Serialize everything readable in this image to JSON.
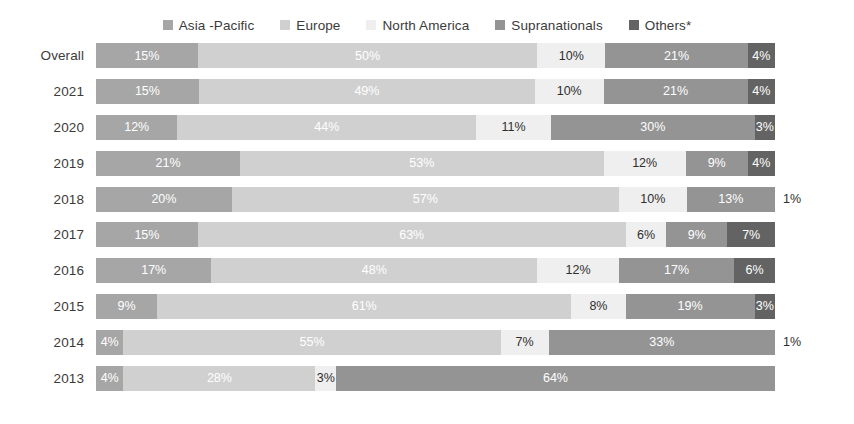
{
  "chart_data": {
    "type": "bar",
    "subtype": "stacked-horizontal-100percent",
    "title": "",
    "subtitle": "",
    "xlabel": "",
    "ylabel": "",
    "xlim": [
      0,
      100
    ],
    "grid": false,
    "legend_position": "top-center",
    "unit": "%",
    "categories": [
      "Overall",
      "2021",
      "2020",
      "2019",
      "2018",
      "2017",
      "2016",
      "2015",
      "2014",
      "2013"
    ],
    "series": [
      {
        "name": "Asia -Pacific",
        "color": "#a6a6a6",
        "values": [
          15,
          15,
          12,
          21,
          20,
          15,
          17,
          9,
          4,
          4
        ]
      },
      {
        "name": "Europe",
        "color": "#d0d0d0",
        "values": [
          50,
          49,
          44,
          53,
          57,
          63,
          48,
          61,
          55,
          28
        ]
      },
      {
        "name": "North America",
        "color": "#efefef",
        "values": [
          10,
          10,
          11,
          12,
          10,
          6,
          12,
          8,
          7,
          3
        ]
      },
      {
        "name": "Supranationals",
        "color": "#949494",
        "values": [
          21,
          21,
          30,
          9,
          13,
          9,
          17,
          19,
          33,
          64
        ]
      },
      {
        "name": "Others*",
        "color": "#636363",
        "values": [
          4,
          4,
          3,
          4,
          1,
          7,
          6,
          3,
          1,
          0
        ]
      }
    ]
  },
  "legend": {
    "items": [
      {
        "label": "Asia  -Pacific",
        "color": "#a6a6a6",
        "icon": "legend-swatch-icon"
      },
      {
        "label": "Europe",
        "color": "#d0d0d0",
        "icon": "legend-swatch-icon"
      },
      {
        "label": "North America",
        "color": "#efefef",
        "icon": "legend-swatch-icon"
      },
      {
        "label": "Supranationals",
        "color": "#949494",
        "icon": "legend-swatch-icon"
      },
      {
        "label": "Others*",
        "color": "#636363",
        "icon": "legend-swatch-icon"
      }
    ]
  },
  "rows": [
    {
      "label": "Overall",
      "segments": [
        {
          "series": "Asia -Pacific",
          "value": 15,
          "text": "15%",
          "color": "#a6a6a6",
          "text_color": "light",
          "outside": false
        },
        {
          "series": "Europe",
          "value": 50,
          "text": "50%",
          "color": "#d0d0d0",
          "text_color": "light",
          "outside": false
        },
        {
          "series": "North America",
          "value": 10,
          "text": "10%",
          "color": "#efefef",
          "text_color": "dark",
          "outside": false
        },
        {
          "series": "Supranationals",
          "value": 21,
          "text": "21%",
          "color": "#949494",
          "text_color": "light",
          "outside": false
        },
        {
          "series": "Others*",
          "value": 4,
          "text": "4%",
          "color": "#636363",
          "text_color": "light",
          "outside": false
        }
      ],
      "outside_label": ""
    },
    {
      "label": "2021",
      "segments": [
        {
          "series": "Asia -Pacific",
          "value": 15,
          "text": "15%",
          "color": "#a6a6a6",
          "text_color": "light",
          "outside": false
        },
        {
          "series": "Europe",
          "value": 49,
          "text": "49%",
          "color": "#d0d0d0",
          "text_color": "light",
          "outside": false
        },
        {
          "series": "North America",
          "value": 10,
          "text": "10%",
          "color": "#efefef",
          "text_color": "dark",
          "outside": false
        },
        {
          "series": "Supranationals",
          "value": 21,
          "text": "21%",
          "color": "#949494",
          "text_color": "light",
          "outside": false
        },
        {
          "series": "Others*",
          "value": 4,
          "text": "4%",
          "color": "#636363",
          "text_color": "light",
          "outside": false
        }
      ],
      "outside_label": ""
    },
    {
      "label": "2020",
      "segments": [
        {
          "series": "Asia -Pacific",
          "value": 12,
          "text": "12%",
          "color": "#a6a6a6",
          "text_color": "light",
          "outside": false
        },
        {
          "series": "Europe",
          "value": 44,
          "text": "44%",
          "color": "#d0d0d0",
          "text_color": "light",
          "outside": false
        },
        {
          "series": "North America",
          "value": 11,
          "text": "11%",
          "color": "#efefef",
          "text_color": "dark",
          "outside": false
        },
        {
          "series": "Supranationals",
          "value": 30,
          "text": "30%",
          "color": "#949494",
          "text_color": "light",
          "outside": false
        },
        {
          "series": "Others*",
          "value": 3,
          "text": "3%",
          "color": "#636363",
          "text_color": "light",
          "outside": false
        }
      ],
      "outside_label": ""
    },
    {
      "label": "2019",
      "segments": [
        {
          "series": "Asia -Pacific",
          "value": 21,
          "text": "21%",
          "color": "#a6a6a6",
          "text_color": "light",
          "outside": false
        },
        {
          "series": "Europe",
          "value": 53,
          "text": "53%",
          "color": "#d0d0d0",
          "text_color": "light",
          "outside": false
        },
        {
          "series": "North America",
          "value": 12,
          "text": "12%",
          "color": "#efefef",
          "text_color": "dark",
          "outside": false
        },
        {
          "series": "Supranationals",
          "value": 9,
          "text": "9%",
          "color": "#949494",
          "text_color": "light",
          "outside": false
        },
        {
          "series": "Others*",
          "value": 4,
          "text": "4%",
          "color": "#636363",
          "text_color": "light",
          "outside": false
        }
      ],
      "outside_label": ""
    },
    {
      "label": "2018",
      "segments": [
        {
          "series": "Asia -Pacific",
          "value": 20,
          "text": "20%",
          "color": "#a6a6a6",
          "text_color": "light",
          "outside": false
        },
        {
          "series": "Europe",
          "value": 57,
          "text": "57%",
          "color": "#d0d0d0",
          "text_color": "light",
          "outside": false
        },
        {
          "series": "North America",
          "value": 10,
          "text": "10%",
          "color": "#efefef",
          "text_color": "dark",
          "outside": false
        },
        {
          "series": "Supranationals",
          "value": 13,
          "text": "13%",
          "color": "#949494",
          "text_color": "light",
          "outside": false
        },
        {
          "series": "Others*",
          "value": 1,
          "text": "1%",
          "color": "#636363",
          "text_color": "dark",
          "outside": true
        }
      ],
      "outside_label": "1%"
    },
    {
      "label": "2017",
      "segments": [
        {
          "series": "Asia -Pacific",
          "value": 15,
          "text": "15%",
          "color": "#a6a6a6",
          "text_color": "light",
          "outside": false
        },
        {
          "series": "Europe",
          "value": 63,
          "text": "63%",
          "color": "#d0d0d0",
          "text_color": "light",
          "outside": false
        },
        {
          "series": "North America",
          "value": 6,
          "text": "6%",
          "color": "#efefef",
          "text_color": "dark",
          "outside": false
        },
        {
          "series": "Supranationals",
          "value": 9,
          "text": "9%",
          "color": "#949494",
          "text_color": "light",
          "outside": false
        },
        {
          "series": "Others*",
          "value": 7,
          "text": "7%",
          "color": "#636363",
          "text_color": "light",
          "outside": false
        }
      ],
      "outside_label": ""
    },
    {
      "label": "2016",
      "segments": [
        {
          "series": "Asia -Pacific",
          "value": 17,
          "text": "17%",
          "color": "#a6a6a6",
          "text_color": "light",
          "outside": false
        },
        {
          "series": "Europe",
          "value": 48,
          "text": "48%",
          "color": "#d0d0d0",
          "text_color": "light",
          "outside": false
        },
        {
          "series": "North America",
          "value": 12,
          "text": "12%",
          "color": "#efefef",
          "text_color": "dark",
          "outside": false
        },
        {
          "series": "Supranationals",
          "value": 17,
          "text": "17%",
          "color": "#949494",
          "text_color": "light",
          "outside": false
        },
        {
          "series": "Others*",
          "value": 6,
          "text": "6%",
          "color": "#636363",
          "text_color": "light",
          "outside": false
        }
      ],
      "outside_label": ""
    },
    {
      "label": "2015",
      "segments": [
        {
          "series": "Asia -Pacific",
          "value": 9,
          "text": "9%",
          "color": "#a6a6a6",
          "text_color": "light",
          "outside": false
        },
        {
          "series": "Europe",
          "value": 61,
          "text": "61%",
          "color": "#d0d0d0",
          "text_color": "light",
          "outside": false
        },
        {
          "series": "North America",
          "value": 8,
          "text": "8%",
          "color": "#efefef",
          "text_color": "dark",
          "outside": false
        },
        {
          "series": "Supranationals",
          "value": 19,
          "text": "19%",
          "color": "#949494",
          "text_color": "light",
          "outside": false
        },
        {
          "series": "Others*",
          "value": 3,
          "text": "3%",
          "color": "#636363",
          "text_color": "light",
          "outside": false
        }
      ],
      "outside_label": ""
    },
    {
      "label": "2014",
      "segments": [
        {
          "series": "Asia -Pacific",
          "value": 4,
          "text": "4%",
          "color": "#a6a6a6",
          "text_color": "light",
          "outside": false
        },
        {
          "series": "Europe",
          "value": 55,
          "text": "55%",
          "color": "#d0d0d0",
          "text_color": "light",
          "outside": false
        },
        {
          "series": "North America",
          "value": 7,
          "text": "7%",
          "color": "#efefef",
          "text_color": "dark",
          "outside": false
        },
        {
          "series": "Supranationals",
          "value": 33,
          "text": "33%",
          "color": "#949494",
          "text_color": "light",
          "outside": false
        },
        {
          "series": "Others*",
          "value": 1,
          "text": "1%",
          "color": "#636363",
          "text_color": "dark",
          "outside": true
        }
      ],
      "outside_label": "1%"
    },
    {
      "label": "2013",
      "segments": [
        {
          "series": "Asia -Pacific",
          "value": 4,
          "text": "4%",
          "color": "#a6a6a6",
          "text_color": "light",
          "outside": false
        },
        {
          "series": "Europe",
          "value": 28,
          "text": "28%",
          "color": "#d0d0d0",
          "text_color": "light",
          "outside": false
        },
        {
          "series": "North America",
          "value": 3,
          "text": "3%",
          "color": "#efefef",
          "text_color": "dark",
          "outside": false
        },
        {
          "series": "Supranationals",
          "value": 64,
          "text": "64%",
          "color": "#949494",
          "text_color": "light",
          "outside": false
        },
        {
          "series": "Others*",
          "value": 0,
          "text": "",
          "color": "#636363",
          "text_color": "light",
          "outside": false
        }
      ],
      "outside_label": ""
    }
  ]
}
